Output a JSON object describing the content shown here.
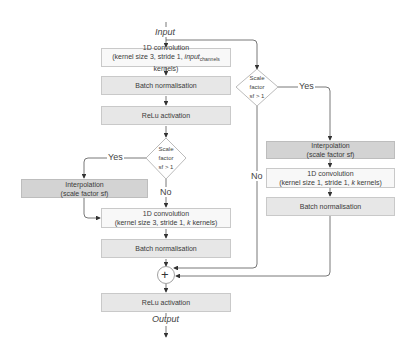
{
  "input_label": "Input",
  "output_label": "Output",
  "main_path": {
    "conv1": {
      "line1": "1D convolution",
      "line2_pre": "(kernel size 3, stride 1, ",
      "line2_italic": "input",
      "line2_sub": "channels",
      "line2_post": " kernels)"
    },
    "bn1": "Batch normalisation",
    "relu1": "ReLu activation",
    "decision": {
      "line1": "Scale",
      "line2": "factor",
      "line3": "sf > 1"
    },
    "yes_label": "Yes",
    "no_label": "No",
    "interp": {
      "line1": "Interpolation",
      "line2": "(scale factor sf)"
    },
    "conv2": {
      "line1": "1D convolution",
      "line2_pre": "(kernel size 3, stride 1, ",
      "line2_italic": "k",
      "line2_post": " kernels)"
    },
    "bn2": "Batch normalisation",
    "add_symbol": "+",
    "relu_out": "ReLu activation"
  },
  "skip_path": {
    "decision": {
      "line1": "Scale",
      "line2": "factor",
      "line3": "sf > 1"
    },
    "yes_label": "Yes",
    "no_label": "No",
    "interp": {
      "line1": "Interpolation",
      "line2": "(scale factor sf)"
    },
    "conv": {
      "line1": "1D convolution",
      "line2_pre": "(kernel size 1, stride 1, ",
      "line2_italic": "k",
      "line2_post": " kernels)"
    },
    "bn": "Batch normalisation"
  }
}
